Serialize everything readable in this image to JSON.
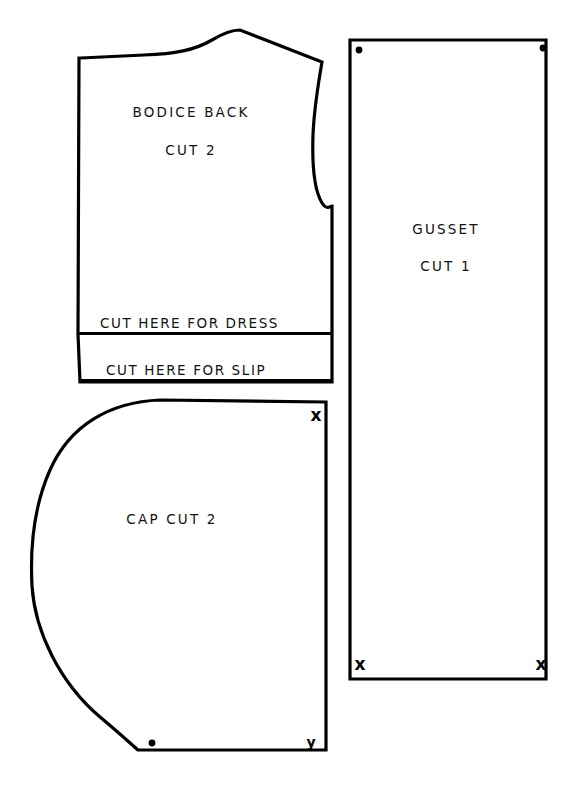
{
  "sheet": {
    "title": "Sewing Pattern Sheet",
    "background_color": "#ffffff",
    "ink_color": "#000000",
    "width": 584,
    "height": 793
  },
  "pieces": {
    "bodice_back": {
      "name_label": "BODICE BACK",
      "cut_label": "CUT 2",
      "cut_line_dress": "CUT HERE FOR DRESS",
      "cut_line_slip": "CUT HERE FOR SLIP"
    },
    "gusset": {
      "name_label": "GUSSET",
      "cut_label": "CUT 1",
      "markers": {
        "top_left": "dot",
        "top_right": "dot",
        "bottom_left": "x",
        "bottom_right": "x"
      },
      "marker_x_label": "x"
    },
    "cap": {
      "name_label": "CAP  CUT 2",
      "markers": {
        "top_right": "x",
        "bottom_right": "y",
        "bottom_edge": "dot"
      },
      "marker_x_label": "x",
      "marker_y_label": "y"
    }
  }
}
